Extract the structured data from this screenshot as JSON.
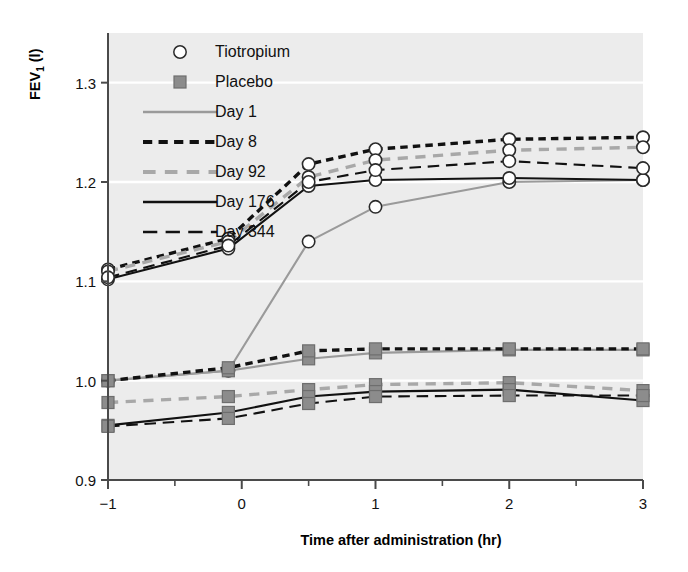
{
  "chart_data": {
    "type": "line",
    "title": "",
    "xlabel": "Time after administration (hr)",
    "ylabel": "FEV1 (l)",
    "ylabel_main": "FEV",
    "ylabel_sub": "1",
    "ylabel_unit": " (l)",
    "xlim": [
      -1,
      3
    ],
    "ylim": [
      0.9,
      1.35
    ],
    "xticks": [
      -1,
      0,
      1,
      2,
      3
    ],
    "xticklabels": [
      "−1",
      "0",
      "1",
      "2",
      "3"
    ],
    "xminorticks": [
      -0.5,
      0.5,
      1.5,
      2.5
    ],
    "yticks": [
      0.9,
      1.0,
      1.1,
      1.2,
      1.3
    ],
    "yticklabels": [
      "0.9",
      "1.0",
      "1.1",
      "1.2",
      "1.3"
    ],
    "grid": "horizontal-white-gridlines",
    "legend_position": "upper-left-inside",
    "plot_background": "#ececec",
    "x": [
      -1,
      -0.1,
      0.5,
      1,
      2,
      3
    ],
    "series": [
      {
        "name": "Day 1",
        "group": "Tiotropium",
        "marker": "open-circle",
        "linestyle": "solid",
        "color": "#9a9a9a",
        "values": [
          1.0,
          1.01,
          1.14,
          1.175,
          1.2,
          1.202
        ]
      },
      {
        "name": "Day 8",
        "group": "Tiotropium",
        "marker": "open-circle",
        "linestyle": "dotted",
        "color": "#111111",
        "values": [
          1.112,
          1.143,
          1.218,
          1.233,
          1.243,
          1.245
        ]
      },
      {
        "name": "Day 92",
        "group": "Tiotropium",
        "marker": "open-circle",
        "linestyle": "dashed",
        "color": "#a8a8a8",
        "values": [
          1.11,
          1.14,
          1.205,
          1.222,
          1.232,
          1.235
        ]
      },
      {
        "name": "Day 176",
        "group": "Tiotropium",
        "marker": "open-circle",
        "linestyle": "solid",
        "color": "#111111",
        "values": [
          1.102,
          1.133,
          1.196,
          1.202,
          1.204,
          1.202
        ]
      },
      {
        "name": "Day 344",
        "group": "Tiotropium",
        "marker": "open-circle",
        "linestyle": "long-dash",
        "color": "#111111",
        "values": [
          1.104,
          1.136,
          1.2,
          1.212,
          1.221,
          1.214
        ]
      },
      {
        "name": "Day 1",
        "group": "Placebo",
        "marker": "filled-square",
        "linestyle": "solid",
        "color": "#9a9a9a",
        "values": [
          1.0,
          1.01,
          1.022,
          1.028,
          1.031,
          1.031
        ]
      },
      {
        "name": "Day 8",
        "group": "Placebo",
        "marker": "filled-square",
        "linestyle": "dotted",
        "color": "#111111",
        "values": [
          1.0,
          1.013,
          1.03,
          1.032,
          1.032,
          1.032
        ]
      },
      {
        "name": "Day 92",
        "group": "Placebo",
        "marker": "filled-square",
        "linestyle": "dashed",
        "color": "#a8a8a8",
        "values": [
          0.978,
          0.984,
          0.991,
          0.996,
          0.998,
          0.99
        ]
      },
      {
        "name": "Day 176",
        "group": "Placebo",
        "marker": "filled-square",
        "linestyle": "solid",
        "color": "#111111",
        "values": [
          0.955,
          0.968,
          0.984,
          0.989,
          0.991,
          0.98
        ]
      },
      {
        "name": "Day 344",
        "group": "Placebo",
        "marker": "filled-square",
        "linestyle": "long-dash",
        "color": "#111111",
        "values": [
          0.954,
          0.962,
          0.977,
          0.984,
          0.985,
          0.985
        ]
      }
    ],
    "legend": {
      "markers": [
        {
          "label": "Tiotropium",
          "symbol": "open-circle"
        },
        {
          "label": "Placebo",
          "symbol": "filled-square"
        }
      ],
      "lines": [
        {
          "label": "Day 1",
          "linestyle": "solid",
          "color": "#9a9a9a"
        },
        {
          "label": "Day 8",
          "linestyle": "dotted",
          "color": "#111111"
        },
        {
          "label": "Day 92",
          "linestyle": "dashed",
          "color": "#a8a8a8"
        },
        {
          "label": "Day 176",
          "linestyle": "solid",
          "color": "#111111"
        },
        {
          "label": "Day 344",
          "linestyle": "long-dash",
          "color": "#111111"
        }
      ]
    }
  }
}
